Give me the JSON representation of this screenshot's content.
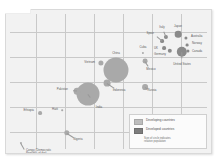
{
  "chart_data": {
    "type": "scatter",
    "title": "",
    "xlabel": "",
    "ylabel": "",
    "grid": true,
    "legend_position": "bottom-right",
    "note": "Bubble area proportional to population; gray bubbles on a gridded light-gray plot panel",
    "legend": {
      "items": [
        {
          "swatch": "light",
          "label": "Developing countries"
        },
        {
          "swatch": "dark",
          "label": "Developed countries"
        }
      ],
      "note_line1": "Size of circle indicates",
      "note_line2": "relative population"
    },
    "series": [
      {
        "name": "Developing countries",
        "group": "developing",
        "points": [
          {
            "label": "China",
            "x": 110,
            "y": 60,
            "r": 12.5,
            "label_x": 110,
            "label_y": 44,
            "align": "c"
          },
          {
            "label": "India",
            "x": 82,
            "y": 84,
            "r": 11.5,
            "label_x": 93,
            "label_y": 98,
            "align": "c"
          },
          {
            "label": "Vietnam",
            "x": 95,
            "y": 53,
            "r": 2.6,
            "label_x": 89,
            "label_y": 53,
            "align": "r"
          },
          {
            "label": "Indonesia",
            "x": 101,
            "y": 73,
            "r": 3.4,
            "label_x": 113,
            "label_y": 81,
            "align": "c"
          },
          {
            "label": "Pakistan",
            "x": 71,
            "y": 81,
            "r": 3.3,
            "label_x": 62,
            "label_y": 80,
            "align": "r"
          },
          {
            "label": "Russia",
            "x": 139,
            "y": 77,
            "r": 2.9,
            "label_x": 146,
            "label_y": 81,
            "align": "c"
          },
          {
            "label": "Mexico",
            "x": 139,
            "y": 51,
            "r": 2.4,
            "label_x": 145,
            "label_y": 60,
            "align": "c"
          },
          {
            "label": "Cuba",
            "x": 137,
            "y": 43,
            "r": 1.1,
            "label_x": 137,
            "label_y": 38,
            "align": "c"
          },
          {
            "label": "Nigeria",
            "x": 61,
            "y": 123,
            "r": 2.7,
            "label_x": 72,
            "label_y": 130,
            "align": "c"
          },
          {
            "label": "Ethiopia",
            "x": 34,
            "y": 103,
            "r": 1.9,
            "label_x": 28,
            "label_y": 101,
            "align": "r"
          },
          {
            "label": "Haiti",
            "x": 56,
            "y": 100,
            "r": 0.8,
            "label_x": 52,
            "label_y": 100,
            "align": "r"
          },
          {
            "label": "Congo (Democratic\nRepublic of the)",
            "x": 15,
            "y": 133,
            "r": 1.1,
            "label_x": 20,
            "label_y": 142,
            "align": "l"
          }
        ]
      },
      {
        "name": "Developed countries",
        "group": "developed",
        "points": [
          {
            "label": "United States",
            "x": 176,
            "y": 42,
            "r": 5.2,
            "label_x": 176,
            "label_y": 55,
            "align": "c"
          },
          {
            "label": "Japan",
            "x": 172,
            "y": 24,
            "r": 3.3,
            "label_x": 172,
            "label_y": 17,
            "align": "c"
          },
          {
            "label": "Italy",
            "x": 160,
            "y": 27,
            "r": 2.1,
            "label_x": 156,
            "label_y": 18,
            "align": "c"
          },
          {
            "label": "Spain",
            "x": 156,
            "y": 31,
            "r": 1.9,
            "label_x": 148,
            "label_y": 24,
            "align": "r"
          },
          {
            "label": "UK",
            "x": 158,
            "y": 38,
            "r": 1.9,
            "label_x": 152,
            "label_y": 39,
            "align": "r"
          },
          {
            "label": "Germany",
            "x": 164,
            "y": 41,
            "r": 2.2,
            "label_x": 160,
            "label_y": 45,
            "align": "r"
          },
          {
            "label": "Australia",
            "x": 180,
            "y": 28,
            "r": 1.6,
            "label_x": 185,
            "label_y": 27,
            "align": "l"
          },
          {
            "label": "Norway",
            "x": 181,
            "y": 35,
            "r": 1.4,
            "label_x": 186,
            "label_y": 34,
            "align": "l"
          },
          {
            "label": "Canada",
            "x": 182,
            "y": 41,
            "r": 1.6,
            "label_x": 186,
            "label_y": 42,
            "align": "l"
          }
        ]
      }
    ],
    "gridlines": {
      "vertical_x": [
        30,
        59,
        88,
        117,
        146,
        175
      ],
      "horizontal_y": [
        22,
        47,
        72,
        97,
        122
      ]
    }
  }
}
